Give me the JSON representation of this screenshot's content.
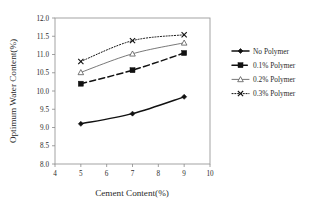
{
  "chart_data": {
    "type": "line",
    "title": "",
    "xlabel": "Cement Content(%)",
    "ylabel": "Optimum Water Content(%)",
    "x": [
      5,
      7,
      9
    ],
    "xlim": [
      4,
      10
    ],
    "ylim": [
      8.0,
      12.0
    ],
    "xticks": [
      "4",
      "5",
      "6",
      "7",
      "8",
      "9",
      "10"
    ],
    "xtick_values": [
      4,
      5,
      6,
      7,
      8,
      9,
      10
    ],
    "yticks": [
      "8.0",
      "8.5",
      "9.0",
      "9.5",
      "10.0",
      "10.5",
      "11.0",
      "11.5",
      "12.0"
    ],
    "ytick_values": [
      8.0,
      8.5,
      9.0,
      9.5,
      10.0,
      10.5,
      11.0,
      11.5,
      12.0
    ],
    "grid": false,
    "legend_position": "right",
    "series": [
      {
        "name": "No Polymer",
        "values": [
          9.1,
          9.38,
          9.84
        ],
        "color": "#111111",
        "dash": "none",
        "width": 1.5,
        "marker": "diamond-filled"
      },
      {
        "name": "0.1% Polymer",
        "values": [
          10.2,
          10.57,
          11.04
        ],
        "color": "#111111",
        "dash": "dashed",
        "width": 1.5,
        "marker": "square-filled"
      },
      {
        "name": "0.2% Polymer",
        "values": [
          10.51,
          11.02,
          11.32
        ],
        "color": "#555555",
        "dash": "none",
        "width": 0.8,
        "marker": "triangle-open"
      },
      {
        "name": "0.3% Polymer",
        "values": [
          10.81,
          11.38,
          11.54
        ],
        "color": "#111111",
        "dash": "dotted",
        "width": 1.0,
        "marker": "cross-x"
      }
    ]
  },
  "axes": {
    "x_label": "Cement Content(%)",
    "y_label": "Optimum Water Content(%)"
  },
  "legend": {
    "items": [
      {
        "label": "No Polymer"
      },
      {
        "label": "0.1% Polymer"
      },
      {
        "label": "0.2% Polymer"
      },
      {
        "label": "0.3% Polymer"
      }
    ]
  },
  "colors": {
    "axis": "#8a8a8a",
    "frame": "#9a9a9a",
    "text": "#2b2b2b",
    "series_dark": "#111111",
    "series_gray": "#555555",
    "background": "#ffffff"
  }
}
